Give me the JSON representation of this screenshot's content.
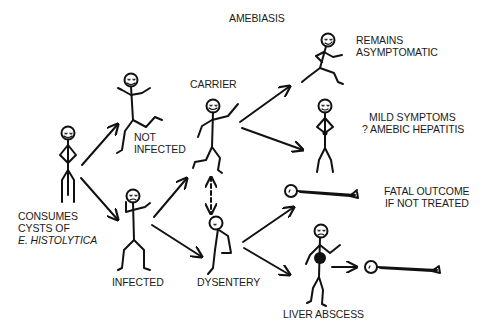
{
  "title": "AMEBIASIS",
  "nodes": {
    "consumes": {
      "lines": [
        "CONSUMES",
        "CYSTS OF"
      ],
      "italic_line": "E. HISTOLYTICA"
    },
    "not_infected": {
      "lines": [
        "NOT",
        "INFECTED"
      ]
    },
    "infected": {
      "lines": [
        "INFECTED"
      ]
    },
    "carrier": {
      "lines": [
        "CARRIER"
      ]
    },
    "dysentery": {
      "lines": [
        "DYSENTERY"
      ]
    },
    "remains_asymptomatic": {
      "lines": [
        "REMAINS",
        "ASYMPTOMATIC"
      ]
    },
    "mild_symptoms": {
      "lines": [
        "MILD SYMPTOMS",
        "? AMEBIC HEPATITIS"
      ]
    },
    "fatal_outcome": {
      "lines": [
        "FATAL OUTCOME",
        "IF NOT TREATED"
      ]
    },
    "liver_abscess": {
      "lines": [
        "LIVER ABSCESS"
      ]
    }
  },
  "edges": [
    {
      "from": "consumes",
      "to": "not_infected",
      "style": "solid"
    },
    {
      "from": "consumes",
      "to": "infected",
      "style": "solid"
    },
    {
      "from": "infected",
      "to": "carrier",
      "style": "solid"
    },
    {
      "from": "infected",
      "to": "dysentery",
      "style": "solid"
    },
    {
      "from": "carrier",
      "to": "dysentery",
      "style": "dashed-bidirectional"
    },
    {
      "from": "carrier",
      "to": "remains_asymptomatic",
      "style": "solid"
    },
    {
      "from": "carrier",
      "to": "mild_symptoms",
      "style": "solid"
    },
    {
      "from": "dysentery",
      "to": "fatal_outcome",
      "style": "solid"
    },
    {
      "from": "dysentery",
      "to": "liver_abscess",
      "style": "solid"
    },
    {
      "from": "liver_abscess",
      "to": "fatal_outcome",
      "style": "solid"
    }
  ]
}
